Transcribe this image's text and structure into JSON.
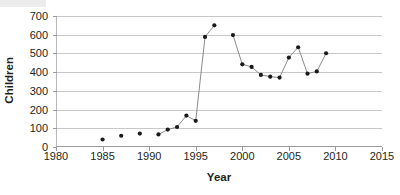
{
  "chart_data": {
    "type": "line",
    "title": "",
    "xlabel": "Year",
    "ylabel": "Children",
    "xlim": [
      1980,
      2015
    ],
    "ylim": [
      0,
      700
    ],
    "xticks": [
      1980,
      1985,
      1990,
      1995,
      2000,
      2005,
      2010,
      2015
    ],
    "yticks": [
      0,
      100,
      200,
      300,
      400,
      500,
      600,
      700
    ],
    "grid": true,
    "legend": null,
    "marker": "filled-circle",
    "marker_color": "#1a1a1a",
    "line_color": "#7f7f7f",
    "x": [
      1985,
      1987,
      1989,
      1991,
      1992,
      1993,
      1994,
      1995,
      1996,
      1997,
      1999,
      2000,
      2001,
      2002,
      2003,
      2004,
      2005,
      2006,
      2007,
      2008,
      2009
    ],
    "values": [
      40,
      60,
      72,
      67,
      93,
      107,
      168,
      140,
      588,
      650,
      598,
      442,
      428,
      385,
      376,
      371,
      478,
      533,
      392,
      404,
      501
    ],
    "connected_segments": [
      [
        1991,
        1992,
        1993,
        1994,
        1995,
        1996,
        1997
      ],
      [
        1999,
        2000,
        2001,
        2002,
        2003,
        2004,
        2005,
        2006,
        2007,
        2008,
        2009
      ]
    ]
  },
  "axes": {
    "y_title": "Children",
    "x_title": "Year",
    "y_tick_labels": [
      "0",
      "100",
      "200",
      "300",
      "400",
      "500",
      "600",
      "700"
    ],
    "x_tick_labels": [
      "1980",
      "1985",
      "1990",
      "1995",
      "2000",
      "2005",
      "2010",
      "2015"
    ]
  }
}
